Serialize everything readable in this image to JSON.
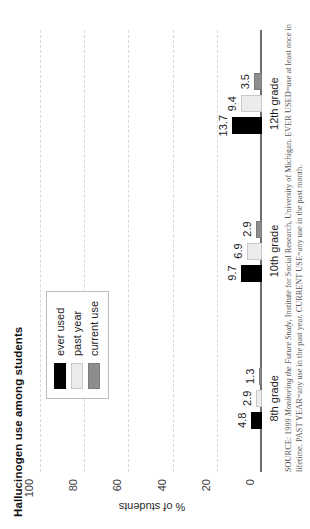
{
  "chart_data": {
    "type": "bar",
    "title": "Hallucinogen use among students",
    "xlabel": "",
    "ylabel": "% of students",
    "categories": [
      "8th grade",
      "10th grade",
      "12th grade"
    ],
    "series": [
      {
        "name": "ever used",
        "color": "#000000",
        "values": [
          4.8,
          9.7,
          13.7
        ]
      },
      {
        "name": "past year",
        "color": "#ececec",
        "values": [
          2.9,
          6.9,
          9.4
        ]
      },
      {
        "name": "current use",
        "color": "#8d8d8d",
        "values": [
          1.3,
          2.9,
          3.5
        ]
      }
    ],
    "ylim": [
      0,
      100
    ],
    "yticks": [
      0,
      20,
      40,
      60,
      80,
      100
    ],
    "ytick_labels": [
      "0",
      "20",
      "40",
      "60",
      "80",
      "100"
    ],
    "grid": true,
    "grid_style": "dashed",
    "grid_color": "#d9d9d9",
    "legend_position": "top-left-inside",
    "orientation": "vertical-bars-rotated-90ccw",
    "data_labels": [
      [
        "4.8",
        "2.9",
        "1.3"
      ],
      [
        "9.7",
        "6.9",
        "2.9"
      ],
      [
        "13.7",
        "9.4",
        "3.5"
      ]
    ]
  },
  "legend": {
    "items": [
      {
        "label": "ever used"
      },
      {
        "label": "past year"
      },
      {
        "label": "current use"
      }
    ]
  },
  "axis": {
    "y_title": "% of students",
    "ticks": [
      {
        "label": "100",
        "value": 100
      },
      {
        "label": "80",
        "value": 80
      },
      {
        "label": "60",
        "value": 60
      },
      {
        "label": "40",
        "value": 40
      },
      {
        "label": "20",
        "value": 20
      },
      {
        "label": "0",
        "value": 0
      }
    ]
  },
  "groups": [
    {
      "label": "8th grade",
      "bars": [
        {
          "series": "ever used",
          "value": 4.8,
          "label": "4.8"
        },
        {
          "series": "past year",
          "value": 2.9,
          "label": "2.9"
        },
        {
          "series": "current use",
          "value": 1.3,
          "label": "1.3"
        }
      ]
    },
    {
      "label": "10th grade",
      "bars": [
        {
          "series": "ever used",
          "value": 9.7,
          "label": "9.7"
        },
        {
          "series": "past year",
          "value": 6.9,
          "label": "6.9"
        },
        {
          "series": "current use",
          "value": 2.9,
          "label": "2.9"
        }
      ]
    },
    {
      "label": "12th grade",
      "bars": [
        {
          "series": "ever used",
          "value": 13.7,
          "label": "13.7"
        },
        {
          "series": "past year",
          "value": 9.4,
          "label": "9.4"
        },
        {
          "series": "current use",
          "value": 3.5,
          "label": "3.5"
        }
      ]
    }
  ],
  "source": {
    "lead": "SOURCE:",
    "text_1": " 1999 ",
    "italic_1": "Monitoring the Future Study",
    "text_2": ", Institute for Social Research, University of Michigan. EVER USED=use at least once in lifetime. PAST YEAR=any use in the past year. CURRENT USE=any use in the past month."
  }
}
